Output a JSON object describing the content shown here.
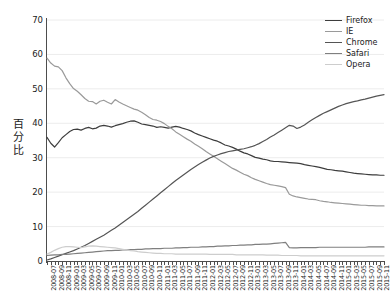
{
  "chart_data": {
    "type": "line",
    "title": "",
    "xlabel": "",
    "ylabel": "百分比",
    "ylim": [
      0,
      70
    ],
    "yticks": [
      0,
      10,
      20,
      30,
      40,
      50,
      60,
      70
    ],
    "grid": true,
    "legend_position": "top-right",
    "x_tick_step_months": 2,
    "x_tick_labels": [
      "2008-07",
      "2008-09",
      "2008-11",
      "2009-01",
      "2009-03",
      "2009-05",
      "2009-07",
      "2009-09",
      "2009-11",
      "2010-01",
      "2010-03",
      "2010-05",
      "2010-07",
      "2010-09",
      "2010-11",
      "2011-01",
      "2011-03",
      "2011-05",
      "2011-07",
      "2011-09",
      "2011-11",
      "2012-01",
      "2012-03",
      "2012-05",
      "2012-07",
      "2012-09",
      "2012-11",
      "2013-01",
      "2013-03",
      "2013-05",
      "2013-07",
      "2013-09",
      "2013-11",
      "2014-01",
      "2014-03",
      "2014-05",
      "2014-07",
      "2014-09",
      "2014-11",
      "2015-01",
      "2015-03",
      "2015-05",
      "2015-07",
      "2015-09",
      "2015-11"
    ],
    "x": [
      "2008-07",
      "2008-08",
      "2008-09",
      "2008-10",
      "2008-11",
      "2008-12",
      "2009-01",
      "2009-02",
      "2009-03",
      "2009-04",
      "2009-05",
      "2009-06",
      "2009-07",
      "2009-08",
      "2009-09",
      "2009-10",
      "2009-11",
      "2009-12",
      "2010-01",
      "2010-02",
      "2010-03",
      "2010-04",
      "2010-05",
      "2010-06",
      "2010-07",
      "2010-08",
      "2010-09",
      "2010-10",
      "2010-11",
      "2010-12",
      "2011-01",
      "2011-02",
      "2011-03",
      "2011-04",
      "2011-05",
      "2011-06",
      "2011-07",
      "2011-08",
      "2011-09",
      "2011-10",
      "2011-11",
      "2011-12",
      "2012-01",
      "2012-02",
      "2012-03",
      "2012-04",
      "2012-05",
      "2012-06",
      "2012-07",
      "2012-08",
      "2012-09",
      "2012-10",
      "2012-11",
      "2012-12",
      "2013-01",
      "2013-02",
      "2013-03",
      "2013-04",
      "2013-05",
      "2013-06",
      "2013-07",
      "2013-08",
      "2013-09",
      "2013-10",
      "2013-11",
      "2013-12",
      "2014-01",
      "2014-02",
      "2014-03",
      "2014-04",
      "2014-05",
      "2014-06",
      "2014-07",
      "2014-08",
      "2014-09",
      "2014-10",
      "2014-11",
      "2014-12",
      "2015-01",
      "2015-02",
      "2015-03",
      "2015-04",
      "2015-05",
      "2015-06",
      "2015-07",
      "2015-08",
      "2015-09",
      "2015-10",
      "2015-11",
      "2015-12"
    ],
    "series": [
      {
        "name": "Firefox",
        "color": "#3d3d3d",
        "values": [
          35.9,
          34.2,
          33.1,
          34.4,
          35.8,
          36.7,
          37.6,
          38.2,
          38.3,
          38.0,
          38.5,
          38.8,
          38.4,
          38.6,
          39.2,
          39.4,
          39.2,
          38.9,
          39.3,
          39.6,
          39.9,
          40.3,
          40.6,
          40.7,
          40.3,
          39.8,
          39.6,
          39.4,
          39.2,
          38.8,
          39.0,
          38.8,
          38.6,
          38.9,
          39.1,
          38.9,
          38.5,
          38.2,
          37.8,
          37.2,
          36.7,
          36.3,
          35.9,
          35.5,
          35.1,
          34.8,
          34.3,
          33.7,
          33.4,
          33.0,
          32.5,
          31.9,
          31.4,
          31.1,
          30.6,
          30.1,
          29.9,
          29.6,
          29.4,
          29.1,
          28.9,
          28.9,
          28.8,
          28.7,
          28.6,
          28.5,
          28.4,
          28.3,
          28.0,
          27.8,
          27.6,
          27.4,
          27.2,
          26.9,
          26.6,
          26.5,
          26.3,
          26.2,
          26.1,
          25.9,
          25.7,
          25.5,
          25.4,
          25.3,
          25.2,
          25.1,
          25.0,
          25.0,
          24.9,
          24.9
        ]
      },
      {
        "name": "IE",
        "color": "#9a9a9a",
        "values": [
          58.9,
          57.5,
          56.6,
          56.4,
          55.3,
          53.2,
          51.5,
          50.1,
          49.3,
          48.3,
          47.2,
          46.4,
          46.3,
          45.6,
          46.4,
          46.7,
          46.1,
          45.6,
          46.9,
          46.2,
          45.6,
          45.1,
          44.6,
          44.1,
          43.8,
          43.2,
          42.5,
          41.7,
          41.1,
          40.9,
          40.5,
          39.9,
          39.1,
          38.4,
          37.5,
          36.8,
          36.1,
          35.4,
          34.8,
          34.0,
          33.3,
          32.6,
          31.8,
          31.1,
          30.4,
          29.7,
          29.0,
          28.3,
          27.6,
          26.9,
          26.4,
          25.8,
          25.2,
          24.8,
          24.2,
          23.7,
          23.3,
          22.9,
          22.5,
          22.2,
          22.0,
          21.8,
          21.6,
          21.3,
          19.4,
          18.9,
          18.6,
          18.4,
          18.2,
          18.0,
          17.9,
          17.8,
          17.5,
          17.3,
          17.2,
          17.0,
          16.9,
          16.8,
          16.7,
          16.6,
          16.5,
          16.4,
          16.3,
          16.2,
          16.2,
          16.1,
          16.1,
          16.0,
          16.0,
          16.0
        ]
      },
      {
        "name": "Chrome",
        "color": "#555555",
        "values": [
          0.3,
          0.6,
          1.0,
          1.4,
          1.8,
          2.2,
          2.6,
          3.0,
          3.5,
          4.0,
          4.5,
          5.1,
          5.7,
          6.3,
          6.9,
          7.5,
          8.2,
          8.9,
          9.6,
          10.4,
          11.2,
          12.0,
          12.8,
          13.6,
          14.4,
          15.3,
          16.2,
          17.1,
          18.0,
          18.9,
          19.8,
          20.7,
          21.6,
          22.5,
          23.4,
          24.2,
          25.0,
          25.8,
          26.6,
          27.3,
          28.0,
          28.7,
          29.3,
          29.9,
          30.4,
          30.8,
          31.2,
          31.5,
          31.8,
          32.0,
          32.2,
          32.4,
          32.6,
          32.9,
          33.2,
          33.6,
          34.1,
          34.7,
          35.3,
          36.0,
          36.6,
          37.3,
          38.0,
          38.7,
          39.4,
          39.2,
          38.5,
          38.9,
          39.5,
          40.3,
          41.0,
          41.7,
          42.3,
          42.9,
          43.4,
          43.9,
          44.4,
          44.9,
          45.3,
          45.7,
          46.0,
          46.3,
          46.5,
          46.8,
          47.0,
          47.3,
          47.6,
          47.9,
          48.1,
          48.3
        ]
      },
      {
        "name": "Safari",
        "color": "#7f7f7f",
        "values": [
          1.6,
          1.7,
          1.8,
          1.8,
          1.9,
          1.9,
          2.0,
          2.1,
          2.2,
          2.3,
          2.4,
          2.5,
          2.6,
          2.7,
          2.8,
          2.9,
          3.0,
          3.0,
          3.1,
          3.1,
          3.2,
          3.2,
          3.3,
          3.3,
          3.4,
          3.4,
          3.5,
          3.5,
          3.6,
          3.6,
          3.6,
          3.7,
          3.7,
          3.7,
          3.8,
          3.8,
          3.9,
          3.9,
          4.0,
          4.0,
          4.0,
          4.1,
          4.1,
          4.2,
          4.2,
          4.3,
          4.3,
          4.4,
          4.4,
          4.5,
          4.5,
          4.6,
          4.6,
          4.7,
          4.7,
          4.8,
          4.8,
          4.9,
          4.9,
          5.0,
          5.1,
          5.2,
          5.3,
          5.4,
          3.9,
          3.8,
          3.8,
          3.9,
          3.9,
          3.9,
          3.9,
          3.9,
          4.0,
          4.0,
          4.0,
          4.0,
          4.0,
          4.0,
          4.0,
          4.0,
          4.0,
          4.0,
          4.0,
          4.0,
          4.0,
          4.1,
          4.1,
          4.1,
          4.1,
          4.1
        ]
      },
      {
        "name": "Opera",
        "color": "#cdcdcd",
        "values": [
          2.0,
          2.5,
          3.1,
          3.6,
          4.0,
          4.2,
          4.2,
          4.1,
          4.0,
          3.9,
          4.1,
          4.3,
          4.4,
          4.3,
          4.2,
          4.1,
          4.0,
          3.9,
          3.8,
          3.6,
          3.4,
          3.2,
          3.0,
          2.9,
          2.7,
          2.6,
          2.5,
          2.4,
          2.3,
          2.2,
          2.2,
          2.1,
          2.1,
          2.1,
          2.0,
          2.0,
          2.0,
          2.0,
          2.0,
          2.0,
          2.0,
          2.0,
          2.0,
          1.9,
          1.9,
          1.9,
          1.9,
          1.9,
          1.9,
          1.9,
          1.8,
          1.8,
          1.8,
          1.8,
          1.8,
          1.8,
          1.8,
          1.8,
          1.7,
          1.7,
          1.7,
          1.7,
          1.6,
          1.6,
          1.6,
          1.6,
          1.6,
          1.5,
          1.5,
          1.5,
          1.5,
          1.5,
          1.5,
          1.5,
          1.5,
          1.5,
          1.5,
          1.5,
          1.5,
          1.5,
          1.5,
          1.5,
          1.5,
          1.5,
          1.5,
          1.5,
          1.5,
          1.5,
          1.5,
          1.5
        ]
      }
    ]
  },
  "legend": {
    "items": [
      {
        "label": "Firefox",
        "color": "#3d3d3d"
      },
      {
        "label": "IE",
        "color": "#9a9a9a"
      },
      {
        "label": "Chrome",
        "color": "#555555"
      },
      {
        "label": "Safari",
        "color": "#7f7f7f"
      },
      {
        "label": "Opera",
        "color": "#cdcdcd"
      }
    ]
  },
  "axes": {
    "y_title": "百分比",
    "grid_color": "#ececec",
    "axis_color": "#4d4d4d"
  }
}
